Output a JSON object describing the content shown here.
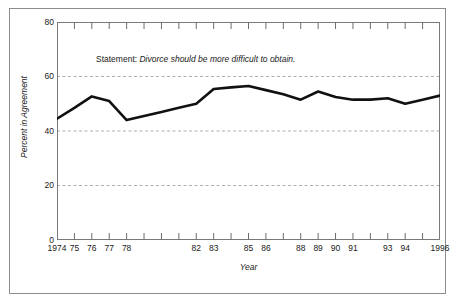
{
  "chart_data": {
    "type": "line",
    "title": "",
    "annotation_lead": "Statement:",
    "annotation_italic": "Divorce should be more difficult to obtain.",
    "xlabel": "Year",
    "ylabel": "Percent in Agreement",
    "ylim": [
      0,
      80
    ],
    "yticks": [
      0,
      20,
      40,
      60,
      80
    ],
    "ytick_labels": [
      "0",
      "20",
      "40",
      "60",
      "80"
    ],
    "xlim": [
      1974,
      1996
    ],
    "xticks": [
      1974,
      1975,
      1976,
      1977,
      1978,
      1979,
      1980,
      1981,
      1982,
      1983,
      1984,
      1985,
      1986,
      1987,
      1988,
      1989,
      1990,
      1991,
      1992,
      1993,
      1994,
      1995,
      1996
    ],
    "xtick_labels": [
      "1974",
      "75",
      "76",
      "77",
      "78",
      "",
      "",
      "",
      "82",
      "83",
      "",
      "85",
      "86",
      "",
      "88",
      "89",
      "90",
      "91",
      "",
      "93",
      "94",
      "",
      "1996"
    ],
    "grid": "horizontal-dashed",
    "gridlines": [
      20,
      40,
      60
    ],
    "legend": "none",
    "line_color": "#111111",
    "line_width": 2.6,
    "x": [
      1974,
      1975,
      1976,
      1977,
      1978,
      1979,
      1980,
      1981,
      1982,
      1983,
      1984,
      1985,
      1986,
      1987,
      1988,
      1989,
      1990,
      1991,
      1992,
      1993,
      1994,
      1995,
      1996
    ],
    "values": [
      44.5,
      48.5,
      52.7,
      51.0,
      44.0,
      45.5,
      47.0,
      48.5,
      50.0,
      55.4,
      56.0,
      56.5,
      55.0,
      53.5,
      51.5,
      54.5,
      52.5,
      51.5,
      51.5,
      52.0,
      50.0,
      51.5,
      53.0
    ],
    "series": [
      {
        "name": "Percent in Agreement",
        "values": [
          44.5,
          48.5,
          52.7,
          51.0,
          44.0,
          45.5,
          47.0,
          48.5,
          50.0,
          55.4,
          56.0,
          56.5,
          55.0,
          53.5,
          51.5,
          54.5,
          52.5,
          51.5,
          51.5,
          52.0,
          50.0,
          51.5,
          53.0
        ]
      }
    ]
  }
}
